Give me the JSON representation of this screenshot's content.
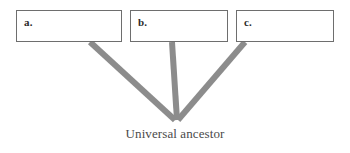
{
  "figure": {
    "type": "phylogenetic-tree-diagram",
    "caption": "Universal ancestor",
    "branch_color": "#8c8c8c",
    "box_border_color": "#6e6e6e",
    "background_color": "#ffffff",
    "text_color": "#4a4a4a",
    "label_color": "#2b2b2b"
  },
  "taxa": [
    {
      "id": "a",
      "label": "a.",
      "box": {
        "x": 16,
        "y": 10,
        "width": 106,
        "height": 32
      },
      "branch": {
        "x1": 90,
        "y1": 42,
        "x2": 175,
        "y2": 120
      }
    },
    {
      "id": "b",
      "label": "b.",
      "box": {
        "x": 130,
        "y": 10,
        "width": 98,
        "height": 32
      },
      "branch": {
        "x1": 172,
        "y1": 42,
        "x2": 177,
        "y2": 120
      }
    },
    {
      "id": "c",
      "label": "c.",
      "box": {
        "x": 236,
        "y": 10,
        "width": 98,
        "height": 32
      },
      "branch": {
        "x1": 245,
        "y1": 42,
        "x2": 178,
        "y2": 120
      }
    }
  ],
  "root": {
    "label": "Universal ancestor",
    "x": 176,
    "y": 120
  }
}
